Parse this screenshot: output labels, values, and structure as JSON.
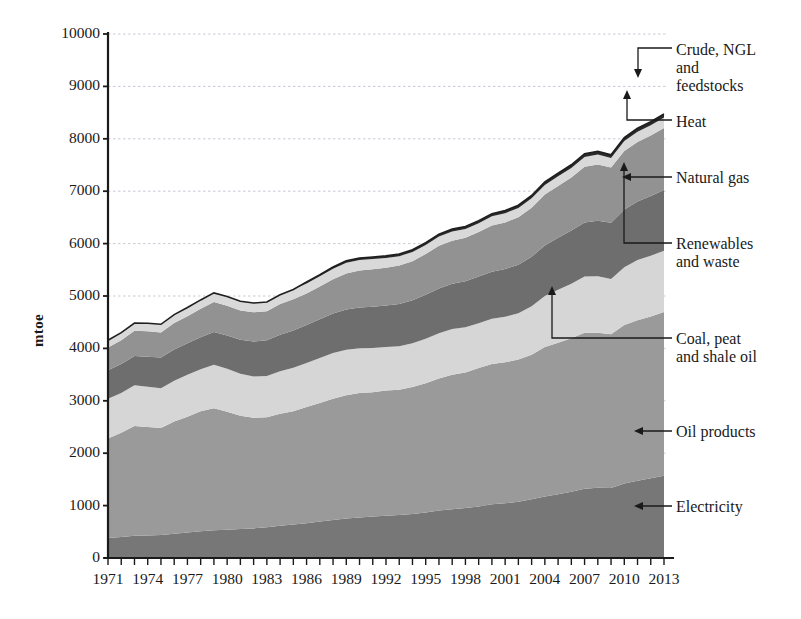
{
  "axes": {
    "ylabel": "mtoe",
    "yticks": [
      "0",
      "1000",
      "2000",
      "3000",
      "4000",
      "5000",
      "6000",
      "7000",
      "8000",
      "9000",
      "10000"
    ],
    "xticks": [
      "1971",
      "1974",
      "1977",
      "1980",
      "1983",
      "1986",
      "1989",
      "1992",
      "1995",
      "1998",
      "2001",
      "2004",
      "2007",
      "2010",
      "2013"
    ]
  },
  "annotations": {
    "crude": "Crude, NGL\nand\nfeedstocks",
    "heat": "Heat",
    "natural_gas": "Natural gas",
    "renewables": "Renewables\nand waste",
    "coal": "Coal, peat\nand shale oil",
    "oil_products": "Oil products",
    "electricity": "Electricity"
  },
  "colors": {
    "electricity": "#777777",
    "oil_products": "#9a9a9a",
    "coal": "#d6d6d6",
    "renewables": "#6e6e6e",
    "natural_gas": "#929292",
    "heat": "#d9d9d9",
    "crude": "#2a2a2a",
    "grid": "#c9c9d6",
    "axis": "#1a1a1a"
  },
  "chart_data": {
    "type": "area",
    "stacked": true,
    "title": "",
    "xlabel": "",
    "ylabel": "mtoe",
    "ylim": [
      0,
      10000
    ],
    "xlim": [
      1971,
      2013
    ],
    "grid": true,
    "legend_position": "right-callouts",
    "x": [
      1971,
      1972,
      1973,
      1974,
      1975,
      1976,
      1977,
      1978,
      1979,
      1980,
      1981,
      1982,
      1983,
      1984,
      1985,
      1986,
      1987,
      1988,
      1989,
      1990,
      1991,
      1992,
      1993,
      1994,
      1995,
      1996,
      1997,
      1998,
      1999,
      2000,
      2001,
      2002,
      2003,
      2004,
      2005,
      2006,
      2007,
      2008,
      2009,
      2010,
      2011,
      2012,
      2013
    ],
    "series": [
      {
        "name": "Electricity",
        "values": [
          380,
          400,
          425,
          430,
          440,
          465,
          485,
          510,
          530,
          540,
          555,
          565,
          585,
          615,
          640,
          665,
          695,
          725,
          755,
          775,
          790,
          805,
          820,
          840,
          870,
          905,
          930,
          955,
          985,
          1025,
          1045,
          1075,
          1120,
          1175,
          1215,
          1265,
          1320,
          1340,
          1335,
          1420,
          1475,
          1520,
          1570
        ]
      },
      {
        "name": "Oil products",
        "values": [
          1900,
          1990,
          2095,
          2070,
          2040,
          2140,
          2210,
          2290,
          2330,
          2250,
          2160,
          2110,
          2100,
          2140,
          2160,
          2215,
          2265,
          2315,
          2350,
          2375,
          2375,
          2390,
          2390,
          2425,
          2465,
          2520,
          2565,
          2585,
          2640,
          2675,
          2690,
          2715,
          2760,
          2850,
          2895,
          2930,
          2980,
          2960,
          2935,
          3025,
          3060,
          3090,
          3125
        ]
      },
      {
        "name": "Coal, peat and shale oil",
        "values": [
          760,
          760,
          775,
          770,
          760,
          780,
          800,
          800,
          830,
          820,
          800,
          790,
          790,
          810,
          830,
          840,
          855,
          870,
          870,
          855,
          845,
          830,
          830,
          835,
          850,
          865,
          875,
          865,
          855,
          865,
          870,
          880,
          925,
          975,
          1010,
          1040,
          1070,
          1075,
          1055,
          1105,
          1150,
          1160,
          1170
        ]
      },
      {
        "name": "Renewables and waste",
        "values": [
          545,
          550,
          560,
          570,
          585,
          595,
          605,
          615,
          625,
          635,
          650,
          665,
          680,
          695,
          710,
          725,
          740,
          755,
          765,
          775,
          785,
          795,
          805,
          820,
          840,
          855,
          865,
          875,
          890,
          900,
          910,
          925,
          945,
          965,
          990,
          1015,
          1035,
          1060,
          1075,
          1100,
          1120,
          1140,
          1160
        ]
      },
      {
        "name": "Natural gas",
        "values": [
          430,
          455,
          480,
          485,
          480,
          505,
          515,
          540,
          570,
          570,
          560,
          560,
          555,
          585,
          600,
          605,
          625,
          655,
          690,
          705,
          715,
          720,
          735,
          745,
          775,
          815,
          820,
          830,
          850,
          880,
          890,
          910,
          935,
          970,
          990,
          1010,
          1060,
          1075,
          1050,
          1115,
          1135,
          1155,
          1180
        ]
      },
      {
        "name": "Heat",
        "values": [
          140,
          145,
          150,
          155,
          155,
          160,
          165,
          170,
          175,
          175,
          175,
          175,
          175,
          180,
          185,
          190,
          195,
          200,
          205,
          200,
          195,
          185,
          180,
          175,
          175,
          175,
          175,
          170,
          170,
          175,
          175,
          175,
          180,
          185,
          185,
          185,
          190,
          190,
          185,
          195,
          195,
          195,
          200
        ]
      },
      {
        "name": "Crude, NGL and feedstocks",
        "values": [
          0,
          0,
          0,
          0,
          0,
          0,
          0,
          0,
          0,
          0,
          0,
          0,
          0,
          0,
          0,
          30,
          32,
          34,
          36,
          38,
          40,
          40,
          42,
          42,
          44,
          46,
          46,
          46,
          48,
          50,
          50,
          52,
          54,
          56,
          58,
          60,
          62,
          62,
          60,
          64,
          66,
          68,
          70
        ]
      }
    ],
    "total_2013": 9275,
    "total_1971": 4155
  }
}
